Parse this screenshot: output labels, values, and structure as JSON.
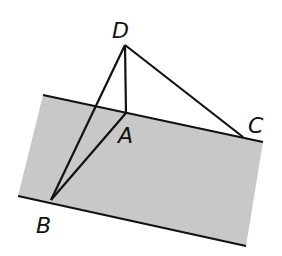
{
  "diagram": {
    "type": "geometry",
    "colors": {
      "plane_fill": "#c8c8c8",
      "line": "#111111",
      "background": "#ffffff"
    },
    "plane": {
      "polygon": [
        [
          43,
          95
        ],
        [
          263,
          142
        ],
        [
          246,
          246
        ],
        [
          18,
          196
        ]
      ],
      "top_edge": [
        [
          43,
          95
        ],
        [
          263,
          142
        ]
      ],
      "bottom_edge": [
        [
          18,
          196
        ],
        [
          246,
          246
        ]
      ]
    },
    "points": {
      "D": {
        "label": "D",
        "x": 125,
        "y": 45,
        "label_x": 112,
        "label_y": 38
      },
      "A": {
        "label": "A",
        "x": 126,
        "y": 113,
        "label_x": 118,
        "label_y": 143
      },
      "C": {
        "label": "C",
        "x": 243,
        "y": 137,
        "label_x": 248,
        "label_y": 133
      },
      "B": {
        "label": "B",
        "x": 51,
        "y": 200,
        "label_x": 36,
        "label_y": 233
      }
    },
    "segments": [
      {
        "name": "DA",
        "from": "D",
        "to": "A"
      },
      {
        "name": "DB",
        "from": "D",
        "to": "B"
      },
      {
        "name": "DC",
        "from": "D",
        "to": "C"
      },
      {
        "name": "AB",
        "from": "A",
        "to": "B"
      }
    ]
  }
}
